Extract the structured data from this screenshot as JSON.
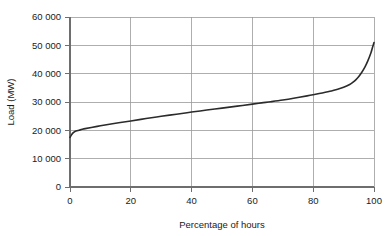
{
  "chart_data": {
    "type": "line",
    "title": "",
    "subtitle": "",
    "xlabel": "Percentage of hours",
    "ylabel": "Load (MW)",
    "xlim": [
      0,
      100
    ],
    "ylim": [
      0,
      60000
    ],
    "grid": true,
    "legend": false,
    "legend_position": "none",
    "xticks": [
      0,
      20,
      40,
      60,
      80,
      100
    ],
    "xtick_labels": [
      "0",
      "20",
      "40",
      "60",
      "80",
      "100"
    ],
    "yticks": [
      0,
      10000,
      20000,
      30000,
      40000,
      50000,
      60000
    ],
    "ytick_labels": [
      "0",
      "10 000",
      "20 000",
      "30 000",
      "40 000",
      "50 000",
      "60 000"
    ],
    "series": [
      {
        "name": "Load duration curve",
        "color": "#2b2b2b",
        "x": [
          0,
          0.5,
          1,
          1.5,
          2,
          3,
          4,
          5,
          7,
          10,
          13,
          16,
          20,
          25,
          30,
          35,
          40,
          45,
          50,
          55,
          60,
          63,
          66,
          70,
          74,
          78,
          80,
          83,
          86,
          88,
          90,
          92,
          93,
          94,
          95,
          96,
          97,
          98,
          99,
          99.5,
          100
        ],
        "y": [
          17500,
          18400,
          19100,
          19500,
          19750,
          20050,
          20350,
          20600,
          21000,
          21600,
          22150,
          22650,
          23300,
          24150,
          24950,
          25700,
          26450,
          27150,
          27850,
          28550,
          29250,
          29700,
          30100,
          30700,
          31400,
          32150,
          32550,
          33200,
          33900,
          34500,
          35200,
          36200,
          36900,
          37800,
          39000,
          40500,
          42300,
          44600,
          47400,
          49200,
          51000
        ]
      }
    ],
    "annotations": []
  },
  "axes": {
    "x_axis_title": "Percentage of hours",
    "y_axis_title": "Load (MW)"
  },
  "colors": {
    "curve": "#2b2b2b",
    "gridline": "#9a9a9a",
    "axis": "#6e6e6e",
    "background": "#ffffff",
    "text": "#1a1a1a"
  }
}
